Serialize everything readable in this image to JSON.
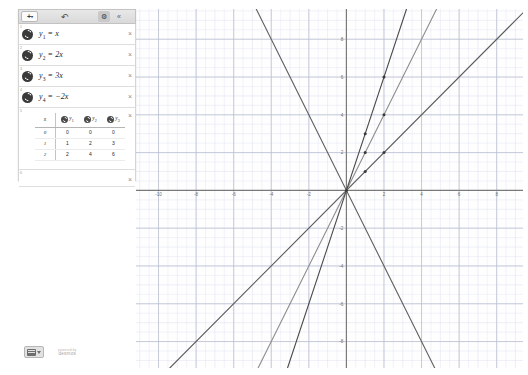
{
  "app": {
    "title": "Desmos Graphing Calculator",
    "brand_small": "powered by",
    "brand_name": "desmos"
  },
  "toolbar": {
    "add_label": "+",
    "add_caret": "▾",
    "undo_icon": "↶",
    "gear_icon": "⚙",
    "collapse_icon": "«",
    "icons": {
      "add": "plus-icon",
      "undo": "undo-icon",
      "gear": "gear-icon",
      "collapse": "collapse-icon"
    }
  },
  "expressions": {
    "delete_icon": "×",
    "items": [
      {
        "index": "1",
        "lhs": "y",
        "sub": "1",
        "eq": "=",
        "rhs": "x",
        "color": "#3a3a3a"
      },
      {
        "index": "2",
        "lhs": "y",
        "sub": "2",
        "eq": "=",
        "rhs": "2x",
        "color": "#3a3a3a"
      },
      {
        "index": "3",
        "lhs": "y",
        "sub": "3",
        "eq": "=",
        "rhs": "3x",
        "color": "#3a3a3a"
      },
      {
        "index": "4",
        "lhs": "y",
        "sub": "4",
        "eq": "=",
        "rhs": "−2x",
        "color": "#3a3a3a"
      }
    ],
    "table": {
      "index": "5",
      "columns": [
        {
          "label": "x",
          "sub": "",
          "swatch": false,
          "color": ""
        },
        {
          "label": "y",
          "sub": "1",
          "swatch": true,
          "color": "#4a4a4a"
        },
        {
          "label": "y",
          "sub": "2",
          "swatch": true,
          "color": "#4a4a4a"
        },
        {
          "label": "y",
          "sub": "3",
          "swatch": true,
          "color": "#4a4a4a"
        }
      ],
      "rows": [
        [
          "0",
          "0",
          "0",
          "0"
        ],
        [
          "1",
          "1",
          "2",
          "3"
        ],
        [
          "2",
          "2",
          "4",
          "6"
        ]
      ]
    },
    "next_index": "6"
  },
  "graph": {
    "x_ticks": [
      {
        "value": -10,
        "label": "-10"
      },
      {
        "value": -8,
        "label": "-8"
      },
      {
        "value": -6,
        "label": "-6"
      },
      {
        "value": -4,
        "label": "-4"
      },
      {
        "value": -2,
        "label": "-2"
      },
      {
        "value": 2,
        "label": "2"
      },
      {
        "value": 4,
        "label": "4"
      },
      {
        "value": 6,
        "label": "6"
      },
      {
        "value": 8,
        "label": "8"
      }
    ],
    "y_ticks": [
      {
        "value": 8,
        "label": "8"
      },
      {
        "value": 6,
        "label": "6"
      },
      {
        "value": 4,
        "label": "4"
      },
      {
        "value": 2,
        "label": "2"
      },
      {
        "value": -2,
        "label": "-2"
      },
      {
        "value": -4,
        "label": "-4"
      },
      {
        "value": -6,
        "label": "-6"
      },
      {
        "value": -8,
        "label": "-8"
      }
    ],
    "grid_color": "#dfe3ef",
    "major_grid_color": "#b9bfd0",
    "axis_color": "#7a7a7a"
  },
  "chart_data": {
    "type": "line",
    "title": "",
    "xlabel": "x",
    "ylabel": "y",
    "xlim": [
      -11.2,
      9.4
    ],
    "ylim": [
      -9.4,
      9.6
    ],
    "grid": true,
    "legend": false,
    "series": [
      {
        "name": "y_1 = x",
        "slope": 1,
        "intercept": 0,
        "color": "#5a5a5a",
        "width": 1.1
      },
      {
        "name": "y_2 = 2x",
        "slope": 2,
        "intercept": 0,
        "color": "#8d8d8d",
        "width": 1.1
      },
      {
        "name": "y_3 = 3x",
        "slope": 3,
        "intercept": 0,
        "color": "#4a4a4a",
        "width": 1.1
      },
      {
        "name": "y_4 = -2x",
        "slope": -2,
        "intercept": 0,
        "color": "#5f5f5f",
        "width": 1.1
      }
    ],
    "points": [
      {
        "x": 0,
        "y": 0
      },
      {
        "x": 1,
        "y": 1
      },
      {
        "x": 2,
        "y": 2
      },
      {
        "x": 1,
        "y": 2
      },
      {
        "x": 2,
        "y": 4
      },
      {
        "x": 1,
        "y": 3
      },
      {
        "x": 2,
        "y": 6
      }
    ]
  }
}
